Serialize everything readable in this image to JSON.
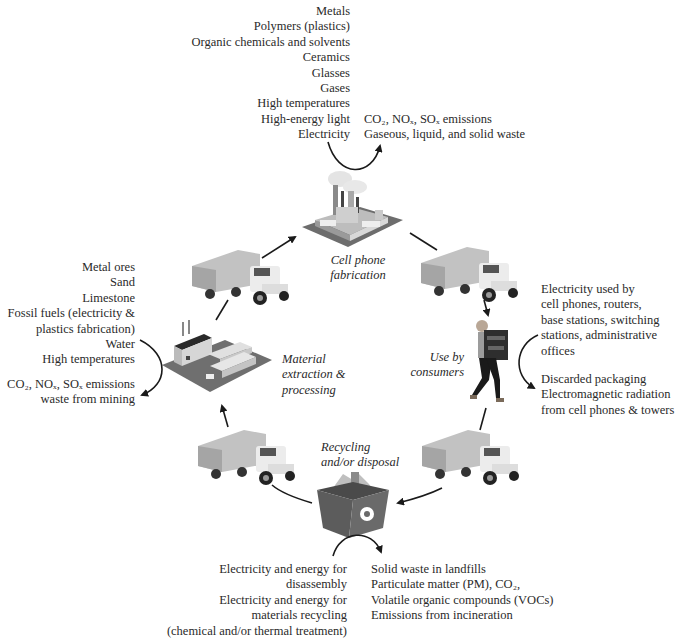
{
  "diagram": {
    "stages": [
      {
        "id": "fabrication",
        "label": [
          "Cell phone",
          "fabrication"
        ]
      },
      {
        "id": "use",
        "label": [
          "Use by",
          "consumers"
        ]
      },
      {
        "id": "recycling",
        "label": [
          "Recycling",
          "and/or disposal"
        ]
      },
      {
        "id": "extraction",
        "label": [
          "Material",
          "extraction &",
          "processing"
        ]
      }
    ],
    "fabrication_inputs": [
      "Metals",
      "Polymers (plastics)",
      "Organic chemicals and solvents",
      "Ceramics",
      "Glasses",
      "Gases",
      "High temperatures",
      "High-energy light",
      "Electricity"
    ],
    "fabrication_outputs": [
      "CO₂, NOₓ, SOₓ emissions",
      "Gaseous, liquid, and solid waste"
    ],
    "use_inputs": [
      "Electricity used by",
      "cell phones, routers,",
      "base stations, switching",
      "stations, administrative",
      "offices"
    ],
    "use_outputs": [
      "Discarded packaging",
      "Electromagnetic radiation",
      "from cell phones & towers"
    ],
    "recycling_inputs": [
      "Electricity and energy for",
      "disassembly",
      "Electricity and energy for",
      "materials recycling",
      "(chemical and/or thermal treatment)"
    ],
    "recycling_outputs": [
      "Solid waste in landfills",
      "Particulate matter (PM), CO₂,",
      "Volatile organic compounds (VOCs)",
      "Emissions from incineration"
    ],
    "extraction_inputs": [
      "Metal ores",
      "Sand",
      "Limestone",
      "Fossil fuels (electricity &",
      "plastics fabrication)",
      "Water",
      "High temperatures"
    ],
    "extraction_outputs": [
      "CO₂, NOₓ, SOₓ emissions",
      "waste from mining"
    ],
    "transport_icons": [
      "truck-icon",
      "truck-icon",
      "truck-icon",
      "truck-icon"
    ],
    "colors": {
      "text": "#2a2a2a",
      "arrow": "#1a1a1a",
      "ground": "#6f6f6f",
      "building": "#c9c9c9",
      "bin": "#555555"
    }
  }
}
